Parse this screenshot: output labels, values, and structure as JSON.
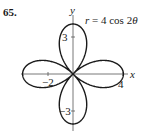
{
  "problem": {
    "number": "65."
  },
  "chart_data": {
    "type": "line",
    "subtype": "polar-rose",
    "title": "r = 4 cos 2θ",
    "equation": {
      "r": "r",
      "eq": "= 4 cos 2",
      "theta": "θ"
    },
    "xlabel": "x",
    "ylabel": "y",
    "x_ticks": [
      {
        "value": -2,
        "label": "−2"
      },
      {
        "value": 4,
        "label": "4"
      }
    ],
    "y_ticks": [
      {
        "value": 3,
        "label": "3"
      },
      {
        "value": -3,
        "label": "−3"
      }
    ],
    "xlim": [
      -4.2,
      4.4
    ],
    "ylim": [
      -4.4,
      4.6
    ],
    "grid": false,
    "legend": "none",
    "amplitude": 4,
    "petals": 4,
    "petal_tips": [
      [
        4,
        0
      ],
      [
        0,
        4
      ],
      [
        -4,
        0
      ],
      [
        0,
        -4
      ]
    ],
    "line_color": "#1a1a1a",
    "axis_color": "#555555"
  }
}
